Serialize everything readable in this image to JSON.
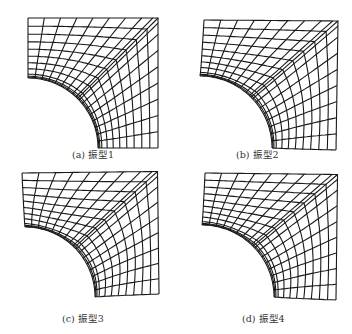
{
  "figure": {
    "panels": [
      {
        "id": "a",
        "caption": "(a) 振型1",
        "mode": 1
      },
      {
        "id": "b",
        "caption": "(b) 振型2",
        "mode": 2
      },
      {
        "id": "c",
        "caption": "(c) 振型3",
        "mode": 3
      },
      {
        "id": "d",
        "caption": "(d) 振型4",
        "mode": 4
      }
    ],
    "line_color": "#1a1a1a",
    "background": "#ffffff"
  }
}
